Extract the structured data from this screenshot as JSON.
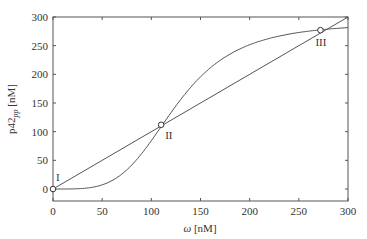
{
  "chart_data": {
    "type": "line",
    "title": "",
    "xlabel": "ω [nM]",
    "ylabel": "p42pp [nM]",
    "ylabel_main": "p42",
    "ylabel_sub": "pp",
    "ylabel_unit": " [nM]",
    "xlim": [
      0,
      300
    ],
    "ylim": [
      -20,
      300
    ],
    "xticks": [
      0,
      50,
      100,
      150,
      200,
      250,
      300
    ],
    "yticks": [
      0,
      50,
      100,
      150,
      200,
      250,
      300
    ],
    "grid": false,
    "legend": null,
    "series": [
      {
        "name": "sigmoid response",
        "x": [
          0,
          25,
          50,
          75,
          100,
          110,
          125,
          150,
          175,
          200,
          225,
          250,
          272,
          300
        ],
        "values": [
          0,
          0.5,
          7,
          33,
          83,
          109,
          145,
          195,
          229,
          252,
          265,
          273,
          277,
          282
        ]
      },
      {
        "name": "identity line",
        "x": [
          0,
          300
        ],
        "values": [
          0,
          300
        ]
      }
    ],
    "annotations": [
      {
        "label": "I",
        "x": 0,
        "y": 0
      },
      {
        "label": "II",
        "x": 110,
        "y": 112
      },
      {
        "label": "III",
        "x": 272,
        "y": 277
      }
    ]
  }
}
